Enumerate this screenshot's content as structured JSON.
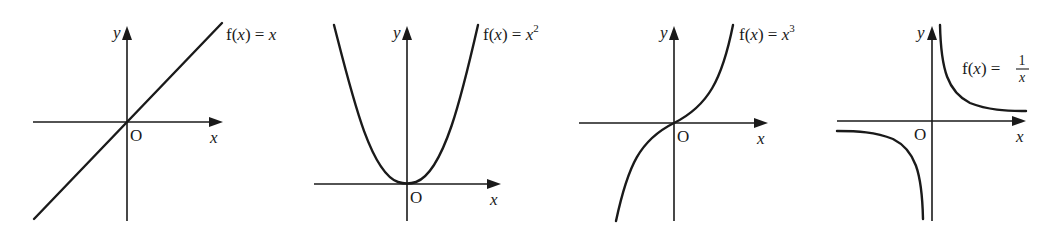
{
  "graphs": [
    {
      "id": "linear",
      "equation_prefix": "f(",
      "equation_var": "x",
      "equation_mid": ") = ",
      "equation_rhs": "x",
      "equation_sup": "",
      "y_label": "y",
      "x_label": "x",
      "origin_label": "O"
    },
    {
      "id": "quadratic",
      "equation_prefix": "f(",
      "equation_var": "x",
      "equation_mid": ") = ",
      "equation_rhs": "x",
      "equation_sup": "2",
      "y_label": "y",
      "x_label": "x",
      "origin_label": "O"
    },
    {
      "id": "cubic",
      "equation_prefix": "f(",
      "equation_var": "x",
      "equation_mid": ") = ",
      "equation_rhs": "x",
      "equation_sup": "3",
      "y_label": "y",
      "x_label": "x",
      "origin_label": "O"
    },
    {
      "id": "reciprocal",
      "equation_prefix": "f(",
      "equation_var": "x",
      "equation_mid": ") = ",
      "equation_num": "1",
      "equation_den": "x",
      "y_label": "y",
      "x_label": "x",
      "origin_label": "O"
    }
  ],
  "colors": {
    "ink": "#1a1a1a",
    "background": "#ffffff"
  }
}
